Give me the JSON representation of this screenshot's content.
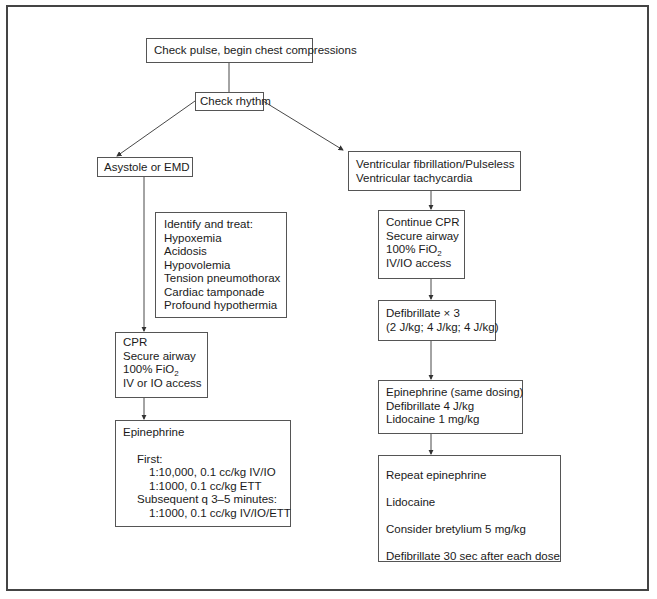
{
  "flowchart": {
    "start": {
      "label": "Check pulse, begin chest compressions"
    },
    "check_rhythm": {
      "label": "Check rhythm"
    },
    "left_branch": {
      "condition": {
        "label": "Asystole or EMD"
      },
      "identify_treat": {
        "heading": "Identify and treat:",
        "items": [
          "Hypoxemia",
          "Acidosis",
          "Hypovolemia",
          "Tension pneumothorax",
          "Cardiac tamponade",
          "Profound hypothermia"
        ]
      },
      "cpr": {
        "lines": [
          "CPR",
          "Secure airway",
          "100% FiO",
          "IV or IO access"
        ],
        "fio2_subscript": "2"
      },
      "epinephrine": {
        "title": "Epinephrine",
        "first_label": "First:",
        "first_doses": [
          "1:10,000, 0.1 cc/kg IV/IO",
          "1:1000, 0.1 cc/kg ETT"
        ],
        "subsequent_label": "Subsequent q 3–5 minutes:",
        "subsequent_doses": [
          "1:1000, 0.1 cc/kg IV/IO/ETT"
        ]
      }
    },
    "right_branch": {
      "condition": {
        "lines": [
          "Ventricular fibrillation/Pulseless",
          "Ventricular tachycardia"
        ]
      },
      "continue_cpr": {
        "lines": [
          "Continue CPR",
          "Secure airway",
          "100% FiO",
          "IV/IO access"
        ],
        "fio2_subscript": "2"
      },
      "defibrillate": {
        "lines": [
          "Defibrillate × 3",
          "(2 J/kg; 4 J/kg; 4 J/kg)"
        ]
      },
      "epinephrine_same": {
        "lines": [
          "Epinephrine (same dosing)",
          "Defibrillate 4 J/kg",
          "Lidocaine 1 mg/kg"
        ]
      },
      "repeat": {
        "lines": [
          "Repeat epinephrine",
          "Lidocaine",
          "Consider bretylium 5 mg/kg",
          "Defibrillate 30 sec after each dose"
        ]
      }
    }
  },
  "colors": {
    "border": "#555555",
    "frame": "#444444",
    "text": "#1a1a1a",
    "background": "#ffffff"
  }
}
